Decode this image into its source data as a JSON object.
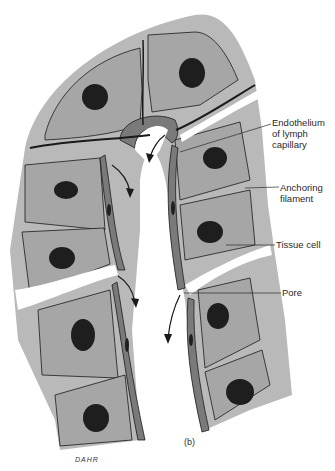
{
  "figure": {
    "caption": "(b)",
    "signature": "DAHR",
    "colors": {
      "tissue_background": "#b9b9b9",
      "cell_fill": "#a6a6a6",
      "endothelium": "#7a7a7a",
      "nucleus": "#1e1e1e",
      "outline": "#1a1a1a",
      "lumen": "#ffffff"
    }
  },
  "labels": [
    {
      "id": "endothelium",
      "lines": [
        "Endothelium",
        "of lymph",
        "capillary"
      ]
    },
    {
      "id": "anchoring-filament",
      "lines": [
        "Anchoring",
        "filament"
      ]
    },
    {
      "id": "tissue-cell",
      "lines": [
        "Tissue cell"
      ]
    },
    {
      "id": "pore",
      "lines": [
        "Pore"
      ]
    }
  ]
}
